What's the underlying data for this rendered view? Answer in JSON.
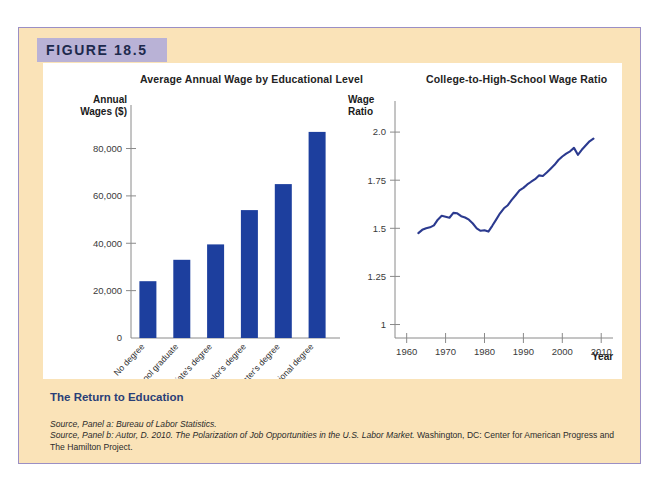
{
  "figure": {
    "tag": "FIGURE 18.5",
    "caption_title": "The Return to Education",
    "source_a_label": "Source, Panel a:",
    "source_a_text": " Bureau of Labor Statistics.",
    "source_b_label": "Source, Panel b:",
    "source_b_plain1": " Autor, D. 2010. ",
    "source_b_italic": "The Polarization of Job Opportunities in the U.S. Labor Market.",
    "source_b_plain2": " Washington, DC: Center for American Progress and The Hamilton Project."
  },
  "colors": {
    "card_background": "#fae3b8",
    "card_border": "#9b8fc4",
    "tag_background": "#b9b2d6",
    "tag_text": "#1d2a4d",
    "panel_background": "#ffffff",
    "bar_fill": "#1d3f9e",
    "line_stroke": "#2b3a8f",
    "axis": "#8a8a8a",
    "caption_title": "#2a3f77"
  },
  "chart_data": [
    {
      "type": "bar",
      "panel": "a",
      "title": "Average Annual Wage by Educational Level",
      "xlabel": "",
      "ylabel": "Annual Wages ($)",
      "ylabel_lines": [
        "Annual",
        "Wages ($)"
      ],
      "ylim": [
        0,
        95000
      ],
      "ytick_values": [
        0,
        20000,
        40000,
        60000,
        80000
      ],
      "ytick_labels": [
        "0",
        "20,000",
        "40,000",
        "60,000",
        "80,000"
      ],
      "grid": false,
      "categories": [
        "No degree",
        "High school graduate",
        "Associate's degree",
        "Bachelor's degree",
        "Master's degree",
        "Professional degree"
      ],
      "values": [
        24000,
        33000,
        39500,
        54000,
        65000,
        87000
      ]
    },
    {
      "type": "line",
      "panel": "b",
      "title": "College-to-High-School Wage Ratio",
      "xlabel": "Year",
      "ylabel": "Wage Ratio",
      "ylabel_lines": [
        "Wage",
        "Ratio"
      ],
      "xlim": [
        1957,
        2012
      ],
      "ylim": [
        0.93,
        2.12
      ],
      "xtick_values": [
        1960,
        1970,
        1980,
        1990,
        2000,
        2010
      ],
      "xtick_labels": [
        "1960",
        "1970",
        "1980",
        "1990",
        "2000",
        "2010"
      ],
      "ytick_values": [
        1,
        1.25,
        1.5,
        1.75,
        2.0
      ],
      "ytick_labels": [
        "1",
        "1.25",
        "1.5",
        "1.75",
        "2.0"
      ],
      "grid": false,
      "series": [
        {
          "name": "College-to-high-school wage ratio",
          "x": [
            1963,
            1964,
            1965,
            1966,
            1967,
            1968,
            1969,
            1970,
            1971,
            1972,
            1973,
            1974,
            1975,
            1976,
            1977,
            1978,
            1979,
            1980,
            1981,
            1982,
            1983,
            1984,
            1985,
            1986,
            1987,
            1988,
            1989,
            1990,
            1991,
            1992,
            1993,
            1994,
            1995,
            1996,
            1997,
            1998,
            1999,
            2000,
            2001,
            2002,
            2003,
            2004,
            2005,
            2006,
            2007,
            2008
          ],
          "values": [
            1.475,
            1.492,
            1.5,
            1.505,
            1.515,
            1.545,
            1.565,
            1.56,
            1.555,
            1.58,
            1.578,
            1.563,
            1.556,
            1.545,
            1.525,
            1.5,
            1.487,
            1.49,
            1.483,
            1.513,
            1.545,
            1.578,
            1.604,
            1.62,
            1.648,
            1.672,
            1.697,
            1.71,
            1.728,
            1.742,
            1.755,
            1.775,
            1.772,
            1.79,
            1.81,
            1.83,
            1.855,
            1.873,
            1.888,
            1.9,
            1.918,
            1.882,
            1.908,
            1.93,
            1.952,
            1.966
          ]
        }
      ]
    }
  ]
}
